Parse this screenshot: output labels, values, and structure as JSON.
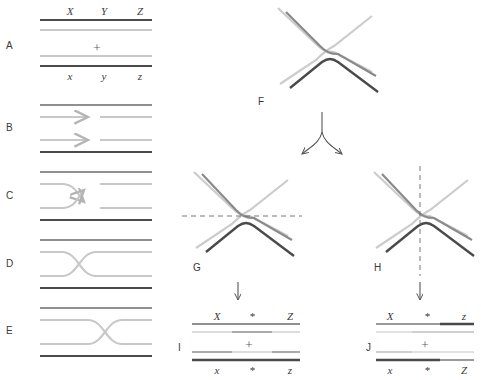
{
  "figure": {
    "type": "diagram",
    "colors": {
      "dark_strand": "#4a4a4a",
      "light_strand": "#c8c8c8",
      "mid_strand": "#9a9a9a",
      "text": "#3a3a3a",
      "dashed_cut": "#6a6a6a",
      "arrow": "#555555",
      "background": "#ffffff"
    }
  },
  "panels": {
    "A": {
      "label": "A",
      "top_labels": [
        "X",
        "Y",
        "Z"
      ],
      "bottom_labels": [
        "x",
        "y",
        "z"
      ],
      "plus": "+",
      "description": "Two homologous DNA duplexes aligned"
    },
    "B": {
      "label": "B",
      "description": "Nicks introduced in strands of the same polarity; arrows show free 3' ends"
    },
    "C": {
      "label": "C",
      "description": "Strand invasion and reciprocal strand exchange"
    },
    "D": {
      "label": "D",
      "description": "Holliday junction formed by crossed single strands"
    },
    "E": {
      "label": "E",
      "description": "Branch migration moves the junction point"
    },
    "F": {
      "label": "F",
      "description": "Open X-form of the Holliday junction"
    },
    "G": {
      "label": "G",
      "cut": "horizontal",
      "description": "Resolution cut in the horizontal plane"
    },
    "H": {
      "label": "H",
      "cut": "vertical",
      "description": "Resolution cut in the vertical plane"
    },
    "I": {
      "label": "I",
      "top_labels": [
        "X",
        "*",
        "Z"
      ],
      "bottom_labels": [
        "x",
        "*",
        "z"
      ],
      "plus": "+",
      "description": "Patch (non-crossover) products with heteroduplex region"
    },
    "J": {
      "label": "J",
      "top_labels": [
        "X",
        "*",
        "z"
      ],
      "bottom_labels": [
        "x",
        "*",
        "Z"
      ],
      "plus": "+",
      "description": "Splice (crossover) recombinant products with heteroduplex region"
    }
  },
  "arrows": {
    "bifurcation": "F splits to G and H",
    "g_to_i": "down arrow",
    "h_to_j": "down arrow"
  }
}
